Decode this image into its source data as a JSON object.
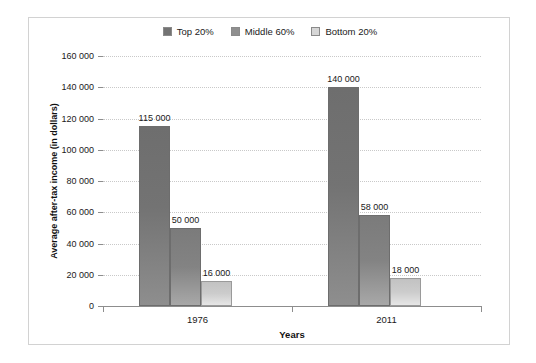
{
  "chart_data": {
    "type": "bar",
    "title": "",
    "xlabel": "Years",
    "ylabel": "Average after-tax income (in dollars)",
    "categories": [
      "1976",
      "2011"
    ],
    "series": [
      {
        "name": "Top 20%",
        "color": "#737373",
        "values": [
          115000,
          140000
        ],
        "labels": [
          "115 000",
          "140 000"
        ]
      },
      {
        "name": "Middle 60%",
        "color": "#838383",
        "values": [
          50000,
          58000
        ],
        "labels": [
          "50 000",
          "58 000"
        ]
      },
      {
        "name": "Bottom 20%",
        "color": "#cccccc",
        "values": [
          16000,
          18000
        ],
        "labels": [
          "16 000",
          "18 000"
        ]
      }
    ],
    "ylim": [
      0,
      160000
    ],
    "ytick_values": [
      0,
      20000,
      40000,
      60000,
      80000,
      100000,
      120000,
      140000,
      160000
    ],
    "ytick_labels": [
      "0",
      "20 000",
      "40 000",
      "60 000",
      "80 000",
      "100 000",
      "120 000",
      "140 000",
      "160 000"
    ],
    "grid": "horizontal-dotted",
    "legend_position": "top-center"
  },
  "legend": {
    "items": [
      {
        "label": "Top 20%",
        "swatch": "#737373"
      },
      {
        "label": "Middle 60%",
        "swatch": "#8f8f8f"
      },
      {
        "label": "Bottom 20%",
        "swatch": "#d6d6d6"
      }
    ]
  }
}
